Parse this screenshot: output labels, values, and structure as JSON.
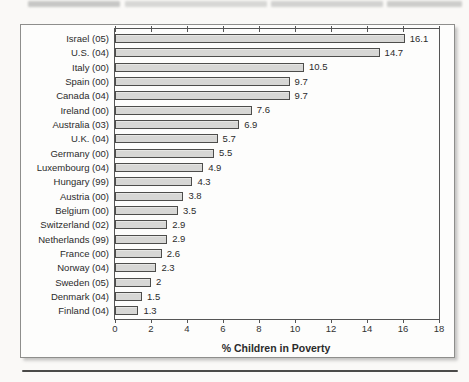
{
  "chart_data": {
    "type": "bar",
    "orientation": "horizontal",
    "title": "",
    "xlabel": "% Children in Poverty",
    "ylabel": "",
    "xlim": [
      0,
      18
    ],
    "grid": false,
    "legend": "none",
    "categories": [
      "Israel (05)",
      "U.S. (04)",
      "Italy (00)",
      "Spain (00)",
      "Canada (04)",
      "Ireland (00)",
      "Australia (03)",
      "U.K. (04)",
      "Germany (00)",
      "Luxembourg (04)",
      "Hungary (99)",
      "Austria (00)",
      "Belgium (00)",
      "Switzerland (02)",
      "Netherlands (99)",
      "France (00)",
      "Norway (04)",
      "Sweden (05)",
      "Denmark (04)",
      "Finland (04)"
    ],
    "values": [
      16.1,
      14.7,
      10.5,
      9.7,
      9.7,
      7.6,
      6.9,
      5.7,
      5.5,
      4.9,
      4.3,
      3.8,
      3.5,
      2.9,
      2.9,
      2.6,
      2.3,
      2,
      1.5,
      1.3
    ],
    "value_labels": [
      "16.1",
      "14.7",
      "10.5",
      "9.7",
      "9.7",
      "7.6",
      "6.9",
      "5.7",
      "5.5",
      "4.9",
      "4.3",
      "3.8",
      "3.5",
      "2.9",
      "2.9",
      "2.6",
      "2.3",
      "2",
      "1.5",
      "1.3"
    ],
    "x_ticks": [
      "0",
      "2",
      "4",
      "6",
      "8",
      "10",
      "12",
      "14",
      "16",
      "18"
    ],
    "colors": {
      "bar_fill": "#d7d7d5",
      "bar_border": "#4d4d4b",
      "plot_border": "#555555",
      "frame_border": "#8e8e8c",
      "text": "#2b2b2b"
    }
  }
}
